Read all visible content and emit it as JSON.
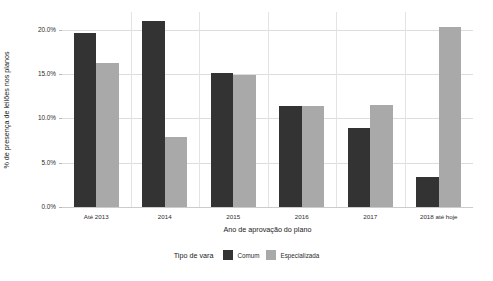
{
  "chart_data": {
    "type": "bar",
    "title": "",
    "xlabel": "Ano de aprovação do plano",
    "ylabel": "% de presença de leilões nos planos",
    "categories": [
      "Até 2013",
      "2014",
      "2015",
      "2016",
      "2017",
      "2018 até hoje"
    ],
    "series": [
      {
        "name": "Comum",
        "color": "#333333",
        "values": [
          19.6,
          21.0,
          15.1,
          11.4,
          8.9,
          3.4
        ]
      },
      {
        "name": "Especializada",
        "color": "#a9a9a9",
        "values": [
          16.2,
          7.9,
          14.9,
          11.4,
          11.5,
          20.3
        ]
      }
    ],
    "ylim": [
      0.0,
      22.0
    ],
    "ytick_labels": [
      "0.0%",
      "5.0%",
      "10.0%",
      "15.0%",
      "20.0%"
    ],
    "ytick_values": [
      0.0,
      5.0,
      10.0,
      15.0,
      20.0
    ],
    "grid": "horizontal-and-vertical",
    "legend_position": "bottom",
    "legend_title": "Tipo de vara"
  },
  "legend": {
    "title": "Tipo de vara",
    "items": [
      {
        "label": "Comum",
        "color": "#333333"
      },
      {
        "label": "Especializada",
        "color": "#a9a9a9"
      }
    ]
  },
  "axes": {
    "y_title": "% de presença de leilões nos planos",
    "x_title": "Ano de aprovação do plano"
  }
}
